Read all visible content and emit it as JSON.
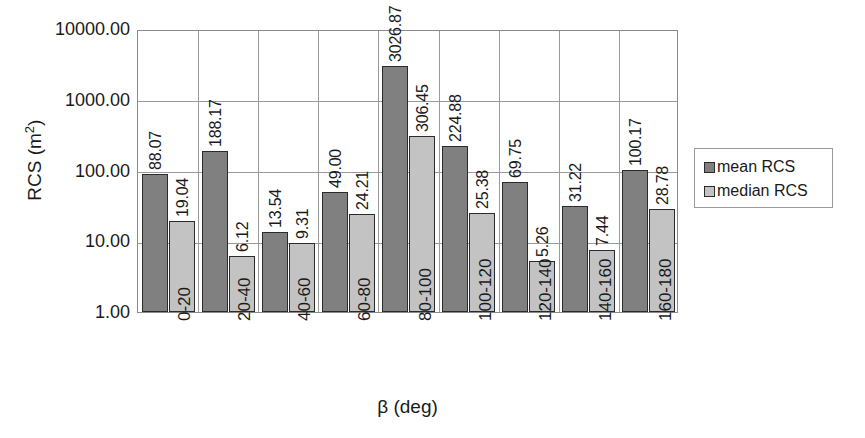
{
  "chart_data": {
    "type": "bar",
    "title": "",
    "xlabel": "β (deg)",
    "ylabel": "RCS (m²)",
    "yscale": "log",
    "ylim": [
      1,
      10000
    ],
    "ytick_labels": [
      "10000.00",
      "1000.00",
      "100.00",
      "10.00",
      "1.00"
    ],
    "ytick_values": [
      10000,
      1000,
      100,
      10,
      1
    ],
    "grid": true,
    "legend_position": "right",
    "categories": [
      "0-20",
      "20-40",
      "40-60",
      "60-80",
      "80-100",
      "100-120",
      "120-140",
      "140-160",
      "160-180"
    ],
    "series": [
      {
        "name": "mean RCS",
        "color": "#808080",
        "values": [
          88.07,
          188.17,
          13.54,
          49.0,
          3026.87,
          224.88,
          69.75,
          31.22,
          100.17
        ],
        "labels": [
          "88.07",
          "188.17",
          "13.54",
          "49.00",
          "3026.87",
          "224.88",
          "69.75",
          "31.22",
          "100.17"
        ]
      },
      {
        "name": "median RCS",
        "color": "#c3c3c3",
        "values": [
          19.04,
          6.12,
          9.31,
          24.21,
          306.45,
          25.38,
          5.26,
          7.44,
          28.78
        ],
        "labels": [
          "19.04",
          "6.12",
          "9.31",
          "24.21",
          "306.45",
          "25.38",
          "5.26",
          "7.44",
          "28.78"
        ]
      }
    ]
  },
  "axis": {
    "y_title_prefix": "RCS (m",
    "y_title_sup": "2",
    "y_title_suffix": ")"
  },
  "legend": {
    "items": [
      {
        "label": "mean RCS"
      },
      {
        "label": "median RCS"
      }
    ]
  }
}
